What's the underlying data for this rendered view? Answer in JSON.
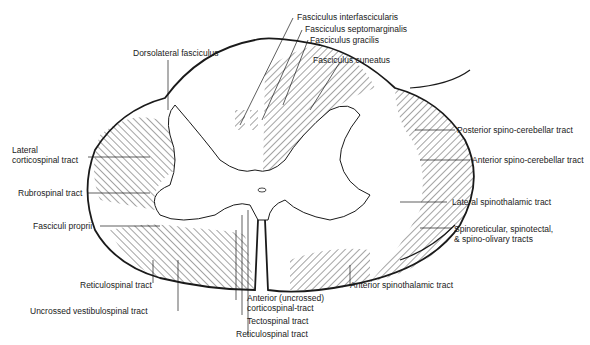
{
  "diagram": {
    "labels": {
      "fasciculus_interfascicularis": "Fasciculus interfascicularis",
      "fasciculus_septomarginalis": "Fasciculus septomarginalis",
      "fasciculus_gracilis": "Fasciculus  gracilis",
      "fasciculus_cuneatus": "Fasciculus cuneatus",
      "dorsolateral_fasciculus": "Dorsolateral fasciculus",
      "lateral_corticospinal_1": "Lateral",
      "lateral_corticospinal_2": "corticospinal tract",
      "rubrospinal": "Rubrospinal tract",
      "fasciculi_proprii": "Fasciculi proprii",
      "reticulospinal_left": "Reticulospinal tract",
      "uncrossed_vestibulospinal": "Uncrossed vestibulospinal tract",
      "anterior_corticospinal_1": "Anterior (uncrossed)",
      "anterior_corticospinal_2": "corticospinal-tract",
      "tectospinal": "Tectospinal tract",
      "reticulospinal_bottom": "Reticulospinal tract",
      "anterior_spinothalamic": "Anterior spinothalamic tract",
      "posterior_spinocerebellar": "Posterior spino-cerebellar tract",
      "anterior_spinocerebellar": "Anterior spino-cerebellar tract",
      "lateral_spinothalamic": "Lateral spinothalamic tract",
      "spinoreticular_1": "Spinoreticular,  spinotectal,",
      "spinoreticular_2": "& spino-olivary tracts"
    },
    "colors": {
      "ink": "#1a1a1a",
      "background": "#ffffff"
    }
  }
}
